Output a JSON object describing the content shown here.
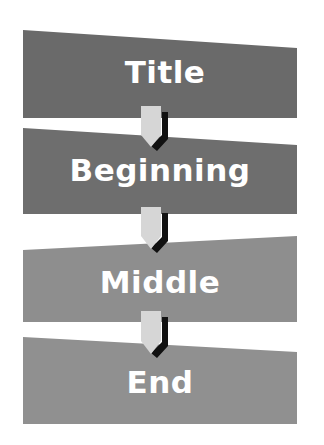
{
  "diagram": {
    "type": "vertical-flow",
    "steps": [
      {
        "label": "Title",
        "color": "#6a6a6a"
      },
      {
        "label": "Beginning",
        "color": "#6e6e6e"
      },
      {
        "label": "Middle",
        "color": "#8e8e8e"
      },
      {
        "label": "End",
        "color": "#909090"
      }
    ],
    "connector": {
      "fill": "#d6d6d6",
      "shadow": "#111111"
    }
  }
}
